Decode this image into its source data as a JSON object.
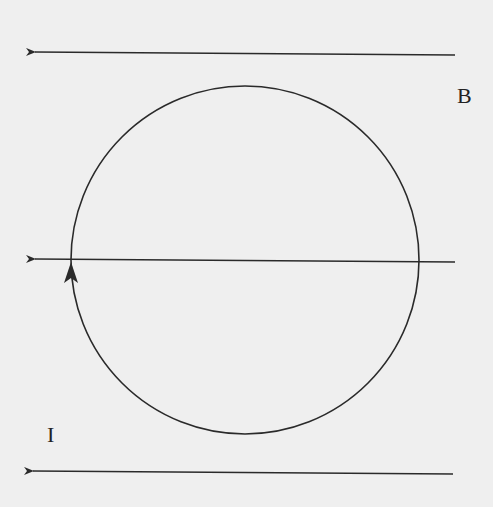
{
  "diagram": {
    "labels": {
      "field": "B",
      "current": "I"
    },
    "colors": {
      "background": "#efefef",
      "stroke": "#2a2a2a"
    },
    "field_lines": [
      {
        "y": 52,
        "x_start": 455,
        "x_end": 33,
        "direction": "left"
      },
      {
        "y": 261,
        "x_start": 455,
        "x_end": 33,
        "direction": "left"
      },
      {
        "y": 471,
        "x_start": 453,
        "x_end": 31,
        "direction": "left"
      }
    ],
    "loop": {
      "cx": 245,
      "cy": 260,
      "r": 174,
      "current_direction": "counterclockwise-visual (arrow pointing up on left side)"
    }
  }
}
